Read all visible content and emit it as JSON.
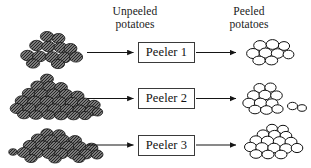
{
  "diagram": {
    "background_color": "#ffffff",
    "ink_color": "#000000",
    "headers": {
      "input_label": "Unpeeled\npotatoes",
      "output_label": "Peeled\npotatoes"
    },
    "rows": [
      {
        "index": 1,
        "process_label": "Peeler 1",
        "input_icon": "unpeeled-potato-pile-icon",
        "output_icon": "peeled-potato-pile-icon",
        "input_arrow_icon": "right-arrow-icon",
        "output_arrow_icon": "right-arrow-icon",
        "input_count": 13,
        "output_count": 9,
        "input_stray_count": 0,
        "output_stray_count": 0,
        "input_pile_shape": "medium-pyramid",
        "output_pile_shape": "small-cluster"
      },
      {
        "index": 2,
        "process_label": "Peeler 2",
        "input_icon": "unpeeled-potato-pile-icon",
        "output_icon": "peeled-potato-pile-icon",
        "input_arrow_icon": "right-arrow-icon",
        "output_arrow_icon": "right-arrow-icon",
        "input_count": 30,
        "output_count": 11,
        "input_stray_count": 0,
        "output_stray_count": 2,
        "input_pile_shape": "large-tall-mound",
        "output_pile_shape": "medium-cluster-with-strays"
      },
      {
        "index": 3,
        "process_label": "Peeler 3",
        "input_icon": "unpeeled-potato-pile-icon",
        "output_icon": "peeled-potato-pile-icon",
        "input_arrow_icon": "right-arrow-icon",
        "output_arrow_icon": "right-arrow-icon",
        "input_count": 22,
        "output_count": 17,
        "input_stray_count": 1,
        "output_stray_count": 0,
        "input_pile_shape": "flat-wide-layer",
        "output_pile_shape": "tall-cluster"
      }
    ],
    "legend": {
      "unpeeled_style": "dark hatched/speckled ellipse",
      "peeled_style": "white ellipse with black outline"
    },
    "colors": {
      "unpeeled_fill": "#6e6e6e",
      "unpeeled_stroke": "#1a1a1a",
      "peeled_fill": "#ffffff",
      "peeled_stroke": "#1a1a1a",
      "box_stroke": "#3a3a3a",
      "arrow": "#1a1a1a"
    }
  }
}
